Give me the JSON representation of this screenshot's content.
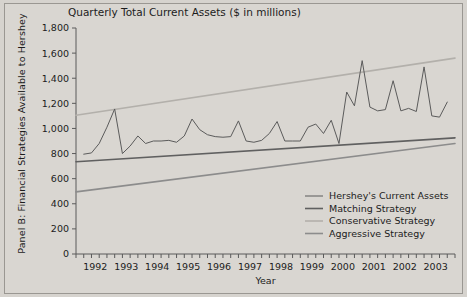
{
  "panel_label": "Panel B: Financial Strategies Available to Hershey",
  "axis_titles": {
    "x": "Year",
    "y": ""
  },
  "chart_data": {
    "type": "line",
    "title": "Quarterly Total Current Assets ($ in millions)",
    "xlabel": "Year",
    "ylabel": "",
    "ylim": [
      0,
      1800
    ],
    "ytick_step": 200,
    "ytick_labels": [
      "0",
      "200",
      "400",
      "600",
      "800",
      "1,000",
      "1,200",
      "1,400",
      "1,600",
      "1,800"
    ],
    "xlim": [
      1991.75,
      2004.0
    ],
    "xtick_labels": [
      "1992",
      "1993",
      "1994",
      "1995",
      "1996",
      "1997",
      "1998",
      "1999",
      "2000",
      "2001",
      "2002",
      "2003"
    ],
    "xtick_values": [
      1992,
      1993,
      1994,
      1995,
      1996,
      1997,
      1998,
      1999,
      2000,
      2001,
      2002,
      2003
    ],
    "minor_ticks_per_year": 4,
    "grid": false,
    "legend_position": "bottom-right",
    "series": [
      {
        "name": "Hershey's Current Assets",
        "color": "#5b5b5b",
        "width": 1.0,
        "x": [
          1992.0,
          1992.25,
          1992.5,
          1992.75,
          1993.0,
          1993.25,
          1993.5,
          1993.75,
          1994.0,
          1994.25,
          1994.5,
          1994.75,
          1995.0,
          1995.25,
          1995.5,
          1995.75,
          1996.0,
          1996.25,
          1996.5,
          1996.75,
          1997.0,
          1997.25,
          1997.5,
          1997.75,
          1998.0,
          1998.25,
          1998.5,
          1998.75,
          1999.0,
          1999.25,
          1999.5,
          1999.75,
          2000.0,
          2000.25,
          2000.5,
          2000.75,
          2001.0,
          2001.25,
          2001.5,
          2001.75,
          2002.0,
          2002.25,
          2002.5,
          2002.75,
          2003.0,
          2003.25,
          2003.5,
          2003.75
        ],
        "values": [
          795,
          805,
          880,
          1010,
          1155,
          800,
          860,
          940,
          880,
          900,
          900,
          905,
          890,
          940,
          1075,
          990,
          950,
          935,
          930,
          935,
          1060,
          900,
          890,
          905,
          960,
          1055,
          900,
          900,
          900,
          1010,
          1035,
          960,
          1065,
          880,
          1290,
          1180,
          1540,
          1170,
          1140,
          1150,
          1380,
          1140,
          1160,
          1135,
          1490,
          1100,
          1090,
          1210
        ]
      },
      {
        "name": "Matching Strategy",
        "color": "#606060",
        "width": 1.6,
        "x": [
          1991.75,
          2004.0
        ],
        "values": [
          735,
          925
        ]
      },
      {
        "name": "Conservative Strategy",
        "color": "#b3b0ab",
        "width": 1.6,
        "x": [
          1991.75,
          2004.0
        ],
        "values": [
          1105,
          1560
        ]
      },
      {
        "name": "Aggressive Strategy",
        "color": "#8c8c8c",
        "width": 1.6,
        "x": [
          1991.75,
          2004.0
        ],
        "values": [
          495,
          880
        ]
      }
    ]
  }
}
